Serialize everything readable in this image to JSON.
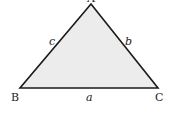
{
  "diagram": {
    "type": "triangle",
    "fill_color": "#ececec",
    "stroke_color": "#1a1a1a",
    "vertices": {
      "A": {
        "label": "A",
        "x": 91,
        "y": 4
      },
      "B": {
        "label": "B",
        "x": 20,
        "y": 88
      },
      "C": {
        "label": "C",
        "x": 158,
        "y": 88
      }
    },
    "sides": {
      "a": {
        "label": "a",
        "between": "B-C"
      },
      "b": {
        "label": "b",
        "between": "A-C"
      },
      "c": {
        "label": "c",
        "between": "A-B"
      }
    }
  }
}
